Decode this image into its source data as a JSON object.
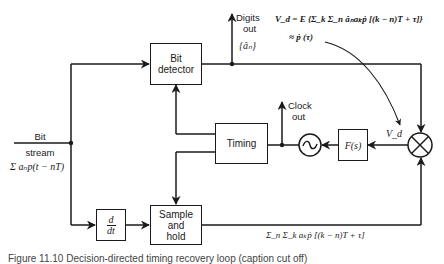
{
  "blocks": {
    "bit_detector": {
      "line1": "Bit",
      "line2": "detector"
    },
    "timing": {
      "label": "Timing"
    },
    "sample_hold": {
      "line1": "Sample",
      "line2": "and",
      "line3": "hold"
    },
    "derivative": {
      "num": "d",
      "den": "dt"
    },
    "loop_filter": {
      "label": "F(s)"
    },
    "vco": {
      "symbol": "~"
    },
    "multiplier": {
      "symbol": "⊗"
    }
  },
  "labels": {
    "input_line1": "Bit",
    "input_line2": "stream",
    "input_expr": "Σ aₙp(t − nT)",
    "digits_out_line1": "Digits",
    "digits_out_line2": "out",
    "digits_out_symbol": "{âₙ}",
    "clock_out_line1": "Clock",
    "clock_out_line2": "out",
    "vd": "V_d",
    "vd_eq_line1": "V_d = E {Σ_k Σ_n âₙaₖṗ [(k − n)T + τ]}",
    "vd_eq_line2": "≈ ṗ (τ)",
    "bottom_expr": "Σ_n Σ_k aₖṗ [(k − n)T + τ]"
  },
  "caption": "Figure 11.10  Decision-directed timing recovery loop (caption cut off)"
}
